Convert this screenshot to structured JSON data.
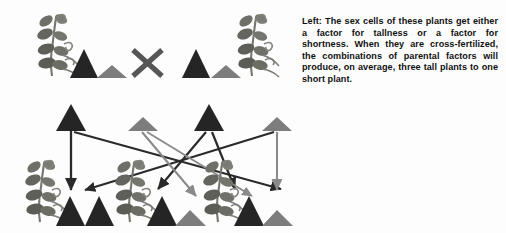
{
  "figure": {
    "background_color": "#fdfdfd",
    "colors": {
      "tall_triangle": "#252525",
      "short_triangle": "#7d7d7d",
      "plant": "#6d6f68",
      "arrow_dark": "#2a2a2a",
      "arrow_light": "#8a8a8a",
      "cross_symbol": "#565656",
      "caption_text": "#101010"
    },
    "legend_meaning": {
      "tall_triangle": "factor for tallness",
      "short_triangle": "factor for shortness",
      "plant": "parent or offspring pea plant",
      "cross_symbol": "cross-fertilization between the two parents"
    }
  },
  "caption": {
    "lead_in": "Left:",
    "text": "Left: The sex cells of these plants get either a factor for tallness or a factor for shortness. When they are cross-fertilized, the combinations of parental factors will produce, on average, three tall plants to one short plant."
  },
  "parent_row": {
    "label": "parent generation",
    "cross_symbol": "X",
    "parents": [
      {
        "name": "parent-left",
        "plant_x": 52,
        "factors": [
          {
            "type": "tall",
            "x": 84
          },
          {
            "type": "short",
            "x": 112
          }
        ]
      },
      {
        "name": "parent-right",
        "plant_x": 252,
        "factors": [
          {
            "type": "tall",
            "x": 196
          },
          {
            "type": "short",
            "x": 226
          }
        ]
      }
    ]
  },
  "gamete_row": {
    "label": "sex cells / gametes",
    "items": [
      {
        "type": "tall",
        "x": 71,
        "from": "parent-left"
      },
      {
        "type": "short",
        "x": 143,
        "from": "parent-left"
      },
      {
        "type": "tall",
        "x": 209,
        "from": "parent-right"
      },
      {
        "type": "short",
        "x": 277,
        "from": "parent-right"
      }
    ]
  },
  "offspring_row": {
    "label": "offspring generation",
    "ratio": "three tall plants to one short plant",
    "offspring": [
      {
        "name": "offspring-1",
        "plant_x": 40,
        "outcome": "tall",
        "factors": [
          {
            "type": "tall",
            "x": 70
          },
          {
            "type": "tall",
            "x": 98
          }
        ]
      },
      {
        "name": "offspring-2",
        "plant_x": 130,
        "outcome": "tall",
        "factors": [
          {
            "type": "tall",
            "x": 162
          },
          {
            "type": "short",
            "x": 190
          }
        ]
      },
      {
        "name": "offspring-3",
        "plant_x": 218,
        "outcome": "tall",
        "factors": [
          {
            "type": "tall",
            "x": 249
          },
          {
            "type": "short",
            "x": 277
          }
        ]
      }
    ]
  },
  "arrows": [
    {
      "name": "arrow-tall-left-to-offspring1-a",
      "shade": "dark",
      "x1": 71,
      "y1": 131,
      "x2": 71,
      "y2": 192
    },
    {
      "name": "arrow-tall-left-to-offspring2",
      "shade": "dark",
      "x1": 73,
      "y1": 131,
      "x2": 282,
      "y2": 191
    },
    {
      "name": "arrow-short-right-to-offspring1",
      "shade": "dark",
      "x1": 275,
      "y1": 131,
      "x2": 84,
      "y2": 192
    },
    {
      "name": "arrow-short-left-to-offspring2",
      "shade": "light",
      "x1": 143,
      "y1": 131,
      "x2": 196,
      "y2": 196
    },
    {
      "name": "arrow-tall-right-to-offspring2",
      "shade": "dark",
      "x1": 207,
      "y1": 131,
      "x2": 158,
      "y2": 191
    },
    {
      "name": "arrow-short-left-to-offspring3",
      "shade": "light",
      "x1": 146,
      "y1": 131,
      "x2": 251,
      "y2": 196
    },
    {
      "name": "arrow-tall-right-to-offspring3",
      "shade": "dark",
      "x1": 211,
      "y1": 131,
      "x2": 236,
      "y2": 191
    },
    {
      "name": "arrow-short-right-down",
      "shade": "light",
      "x1": 277,
      "y1": 131,
      "x2": 277,
      "y2": 192
    }
  ]
}
